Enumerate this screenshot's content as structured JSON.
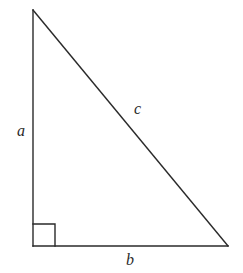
{
  "diagram": {
    "type": "right-triangle",
    "labels": {
      "a": "a",
      "b": "b",
      "c": "c"
    },
    "vertices": {
      "top": [
        33,
        10
      ],
      "bottom_left": [
        33,
        246
      ],
      "bottom_right": [
        228,
        246
      ]
    },
    "right_angle_marker": {
      "corner": "bottom_left",
      "size": 22
    },
    "colors": {
      "line": "#2a2a2a",
      "background": "#ffffff"
    }
  }
}
